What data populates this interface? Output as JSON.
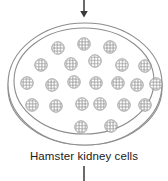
{
  "figure": {
    "type": "biology-diagram",
    "caption": "Hamster kidney cells",
    "colors": {
      "stroke": "#8d8d8d",
      "arrow": "#3a3a3a",
      "cell_stroke": "#9a9a9a",
      "text": "#1a1a1a",
      "background": "#ffffff"
    },
    "arrow_top": {
      "name": "inflow-arrow",
      "direction": "down",
      "x": 84,
      "y_start": 0,
      "y_end": 21
    },
    "connector_bottom": {
      "name": "outflow-connector",
      "direction": "down",
      "x": 84,
      "y_start": 165,
      "y_end": 181
    },
    "dish": {
      "outer": {
        "cx": 85,
        "cy": 84,
        "rx": 77,
        "ry": 61
      },
      "inner": {
        "cx": 84,
        "cy": 81,
        "rx": 70,
        "ry": 53
      },
      "rim": {
        "cx": 85,
        "cy": 88,
        "rx": 77,
        "ry": 57
      }
    },
    "cells": {
      "count": 23,
      "radius": 6.2,
      "hatch_label": "cross-hatched granular cell",
      "positions": [
        {
          "x": 58,
          "y": 48
        },
        {
          "x": 84,
          "y": 44
        },
        {
          "x": 110,
          "y": 47
        },
        {
          "x": 41,
          "y": 65
        },
        {
          "x": 71,
          "y": 64
        },
        {
          "x": 95,
          "y": 61
        },
        {
          "x": 122,
          "y": 65
        },
        {
          "x": 145,
          "y": 66
        },
        {
          "x": 27,
          "y": 83
        },
        {
          "x": 52,
          "y": 85
        },
        {
          "x": 74,
          "y": 82
        },
        {
          "x": 96,
          "y": 83
        },
        {
          "x": 118,
          "y": 83
        },
        {
          "x": 137,
          "y": 85
        },
        {
          "x": 156,
          "y": 84
        },
        {
          "x": 32,
          "y": 105
        },
        {
          "x": 56,
          "y": 106
        },
        {
          "x": 82,
          "y": 104
        },
        {
          "x": 100,
          "y": 104
        },
        {
          "x": 124,
          "y": 105
        },
        {
          "x": 145,
          "y": 105
        },
        {
          "x": 81,
          "y": 127
        },
        {
          "x": 111,
          "y": 126
        }
      ]
    }
  }
}
